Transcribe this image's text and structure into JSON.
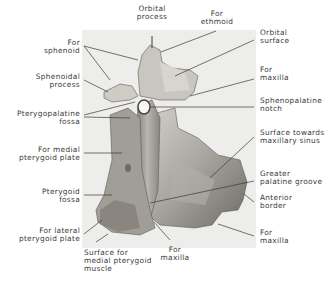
{
  "figure": {
    "colors": {
      "background": "#ffffff",
      "photo_background": "#ededeb",
      "bone_light": "#c9c6c0",
      "bone_mid": "#9e9a94",
      "bone_dark": "#5e5a55",
      "leader_line": "#3a3a3a",
      "label_text": "#3a3a3a"
    }
  },
  "labels": {
    "orbital_process": "Orbital\nprocess",
    "for_ethmoid": "For\nethmoid",
    "orbital_surface": "Orbital\nsurface",
    "for_maxilla_upper": "For\nmaxilla",
    "sphenopalatine_notch": "Sphenopalatine\nnotch",
    "surface_towards_maxillary_sinus": "Surface towards\nmaxillary sinus",
    "greater_palatine_groove": "Greater\npalatine groove",
    "anterior_border": "Anterior\nborder",
    "for_maxilla_lower_right": "For\nmaxilla",
    "for_maxilla_bottom": "For\nmaxilla",
    "surface_for_medial_pterygoid_muscle": "Surface for\nmedial pterygoid\nmuscle",
    "for_lateral_pterygoid_plate": "For lateral\npterygoid plate",
    "pterygoid_fossa": "Pterygoid\nfossa",
    "for_medial_pterygoid_plate": "For medial\npterygoid plate",
    "pterygopalatine_fossa": "Pterygopalatine\nfossa",
    "sphenoidal_process": "Sphenoidal\nprocess",
    "for_sphenoid": "For\nsphenoid"
  }
}
